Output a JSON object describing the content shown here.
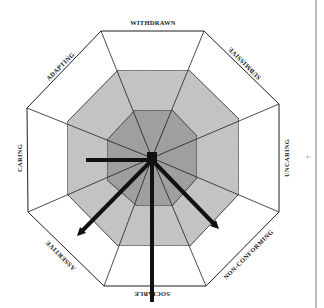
{
  "diagram": {
    "type": "octagonal circumplex profile",
    "labels": {
      "top": "WITHDRAWN",
      "top_right": "SUBMISSIVE",
      "right": "UNCARING",
      "bottom_right": "NON-CONFORMING",
      "bottom": "SOCIABLE",
      "bottom_left": "ASSERTIVE",
      "left": "CARING",
      "top_left": "ADAPTING"
    },
    "rings": [
      "outer (white)",
      "middle (light grey)",
      "inner (dark grey)"
    ],
    "arrows": [
      {
        "direction": "CARING",
        "length": "middle ring"
      },
      {
        "direction": "ASSERTIVE",
        "length": "outer ring"
      },
      {
        "direction": "SOCIABLE",
        "length": "beyond outer ring"
      },
      {
        "direction": "NON-CONFORMING",
        "length": "outer ring"
      }
    ],
    "colors": {
      "outer_fill": "#ffffff",
      "middle_fill": "#c4c4c4",
      "inner_fill": "#9c9c9c",
      "stroke": "#1e1e1e",
      "arrow": "#111111"
    }
  },
  "page": {
    "number": "7"
  }
}
